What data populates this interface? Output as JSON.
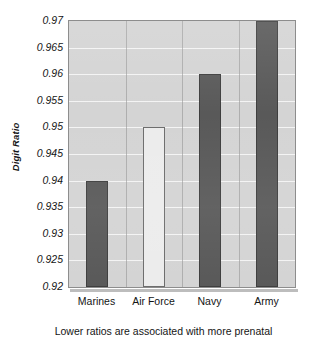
{
  "chart_data": {
    "type": "bar",
    "title": "",
    "categories": [
      "Marines",
      "Air Force",
      "Navy",
      "Army"
    ],
    "values": [
      0.94,
      0.95,
      0.96,
      0.97
    ],
    "series": [
      {
        "name": "Digit Ratio",
        "values": [
          0.94,
          0.95,
          0.96,
          0.97
        ]
      }
    ],
    "bar_styles": [
      "dark",
      "light",
      "dark",
      "dark"
    ],
    "xlabel": "",
    "ylabel": "Digit Ratio",
    "ylim": [
      0.92,
      0.97
    ],
    "yticks": [
      0.97,
      0.965,
      0.96,
      0.955,
      0.95,
      0.945,
      0.94,
      0.935,
      0.93,
      0.925,
      0.92
    ],
    "ytick_labels": [
      "0.97",
      "0.965",
      "0.96",
      "0.955",
      "0.95",
      "0.945",
      "0.94",
      "0.935",
      "0.93",
      "0.925",
      "0.92"
    ],
    "grid": true,
    "grid_orientation": "horizontal",
    "legend": false,
    "legend_position": "none",
    "colors": {
      "bar_dark": "#595959",
      "bar_light": "#ececec",
      "bar_outline": "#3e3e3e",
      "plot_background": "#d4d4d4",
      "gridline": "#f4f4f4",
      "axis_border": "#8d8d8d",
      "text": "#151515"
    }
  },
  "figure": {
    "title_remnant": "",
    "caption": "Lower ratios are associated with more prenatal"
  }
}
